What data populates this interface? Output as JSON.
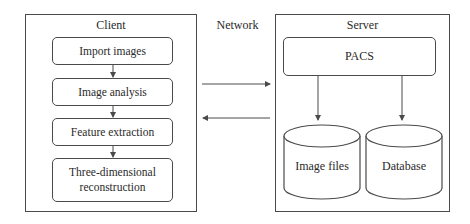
{
  "client": {
    "title": "Client",
    "steps": [
      {
        "label": "Import images"
      },
      {
        "label": "Image analysis"
      },
      {
        "label": "Feature extraction"
      },
      {
        "label": "Three-dimensional reconstruction"
      }
    ]
  },
  "network": {
    "label": "Network",
    "arrows": [
      {
        "direction": "client-to-server"
      },
      {
        "direction": "server-to-client"
      }
    ]
  },
  "server": {
    "title": "Server",
    "pacs": {
      "label": "PACS"
    },
    "stores": [
      {
        "label": "Image files",
        "shape": "cylinder"
      },
      {
        "label": "Database",
        "shape": "cylinder"
      }
    ]
  },
  "colors": {
    "stroke": "#4a4a4a",
    "text": "#2a2a2a",
    "background": "#ffffff"
  }
}
